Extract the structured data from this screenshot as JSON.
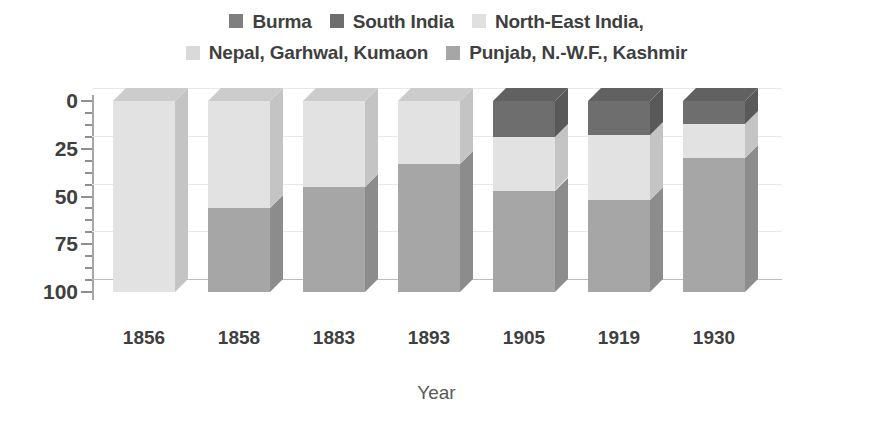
{
  "legend": {
    "rows": [
      [
        {
          "label": "Burma",
          "color": "#7f7f7f",
          "name": "legend-item-burma"
        },
        {
          "label": "South India",
          "color": "#6e6e6e",
          "name": "legend-item-south-india"
        },
        {
          "label": "North-East India,",
          "color": "#e0e0e0",
          "name": "legend-item-north-east-india"
        }
      ],
      [
        {
          "label": "Nepal, Garhwal, Kumaon",
          "color": "#d9d9d9",
          "name": "legend-item-nepal-garhwal-kumaon"
        },
        {
          "label": "Punjab, N.-W.F., Kashmir",
          "color": "#a6a6a6",
          "name": "legend-item-punjab-nwf-kashmir"
        }
      ]
    ]
  },
  "axes": {
    "y_ticks": [
      "100",
      "75",
      "50",
      "25",
      "0"
    ],
    "x_labels": [
      "1856",
      "1858",
      "1883",
      "1893",
      "1905",
      "1919",
      "1930"
    ],
    "x_title": "Year"
  },
  "chart_data": {
    "type": "bar",
    "title": "",
    "subtitle": "",
    "stacked": true,
    "three_d": true,
    "xlabel": "Year",
    "ylabel": "",
    "ylim": [
      0,
      100
    ],
    "y_ticks": [
      0,
      25,
      50,
      75,
      100
    ],
    "y_minor_tick_step": 6.25,
    "grid": true,
    "legend_position": "top",
    "categories": [
      "1856",
      "1858",
      "1883",
      "1893",
      "1905",
      "1919",
      "1930"
    ],
    "series": [
      {
        "name": "Punjab, N.-W.F., Kashmir",
        "color": "#a6a6a6",
        "side_color": "#8c8c8c",
        "top_color": "#919191",
        "values": [
          0,
          44,
          55,
          67,
          53,
          48,
          70
        ]
      },
      {
        "name": "North-East India, Nepal, Garhwal, Kumaon",
        "color": "#e2e2e2",
        "side_color": "#c4c4c4",
        "top_color": "#cccccc",
        "values": [
          100,
          56,
          45,
          33,
          28,
          34,
          18
        ]
      },
      {
        "name": "South India",
        "color": "#6e6e6e",
        "side_color": "#595959",
        "top_color": "#616161",
        "values": [
          0,
          0,
          0,
          0,
          19,
          18,
          12
        ]
      },
      {
        "name": "Burma",
        "color": "#7f7f7f",
        "side_color": "#6b6b6b",
        "top_color": "#727272",
        "values": [
          0,
          0,
          0,
          0,
          0,
          0,
          0
        ]
      }
    ]
  }
}
